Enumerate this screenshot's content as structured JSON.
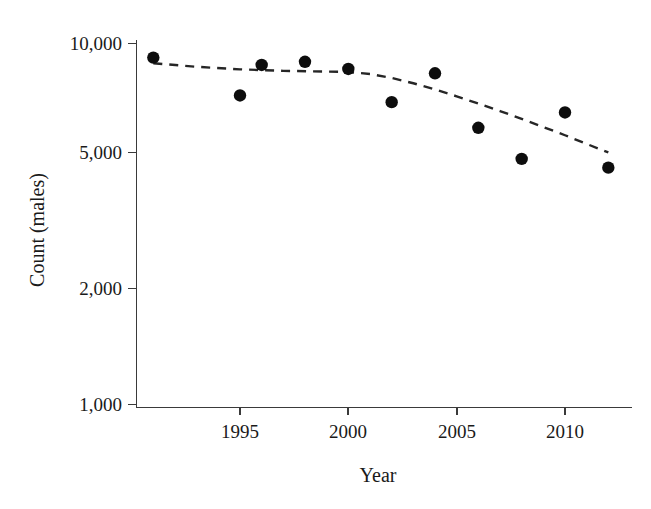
{
  "chart_data": {
    "type": "scatter",
    "title": "",
    "subtitle": "",
    "xlabel": "Year",
    "ylabel": "Count (males)",
    "yscale": "log",
    "xscale": "linear",
    "grid": false,
    "legend": null,
    "xlim": [
      1990.2,
      2013.0
    ],
    "ylim": [
      1000,
      11000
    ],
    "xticks": [
      1995,
      2000,
      2005,
      2010
    ],
    "xtick_labels": [
      "1995",
      "2000",
      "2005",
      "2010"
    ],
    "yticks": [
      1000,
      2000,
      5000,
      10000
    ],
    "ytick_labels": [
      "1,000",
      "2,000",
      "5,000",
      "10,000"
    ],
    "x": [
      1991,
      1995,
      1996,
      1998,
      2000,
      2002,
      2004,
      2006,
      2008,
      2010,
      2012
    ],
    "values": [
      9140,
      7180,
      8720,
      8900,
      8500,
      6880,
      8270,
      5840,
      4790,
      6440,
      4530
    ],
    "series": [
      {
        "name": "Count (males)",
        "marker": "filled-circle",
        "color": "#0d0d0d",
        "x": [
          1991,
          1995,
          1996,
          1998,
          2000,
          2002,
          2004,
          2006,
          2008,
          2010,
          2012
        ],
        "values": [
          9140,
          7180,
          8720,
          8900,
          8500,
          6880,
          8270,
          5840,
          4790,
          6440,
          4530
        ]
      },
      {
        "name": "trend",
        "style": "dashed",
        "color": "#262626",
        "x": [
          1991,
          1993,
          1995,
          1997,
          1999,
          2000,
          2001,
          2002,
          2003,
          2004,
          2005,
          2006,
          2007,
          2008,
          2009,
          2010,
          2011,
          2012
        ],
        "values": [
          8820,
          8620,
          8480,
          8400,
          8360,
          8340,
          8230,
          8030,
          7760,
          7460,
          7140,
          6820,
          6500,
          6180,
          5870,
          5570,
          5270,
          4990
        ]
      }
    ],
    "annotations": []
  },
  "axes": {
    "y_title": "Count (males)",
    "x_title": "Year",
    "y_tick_labels": [
      "10,000",
      "5,000",
      "2,000",
      "1,000"
    ],
    "x_tick_labels": [
      "1995",
      "2000",
      "2005",
      "2010"
    ]
  }
}
